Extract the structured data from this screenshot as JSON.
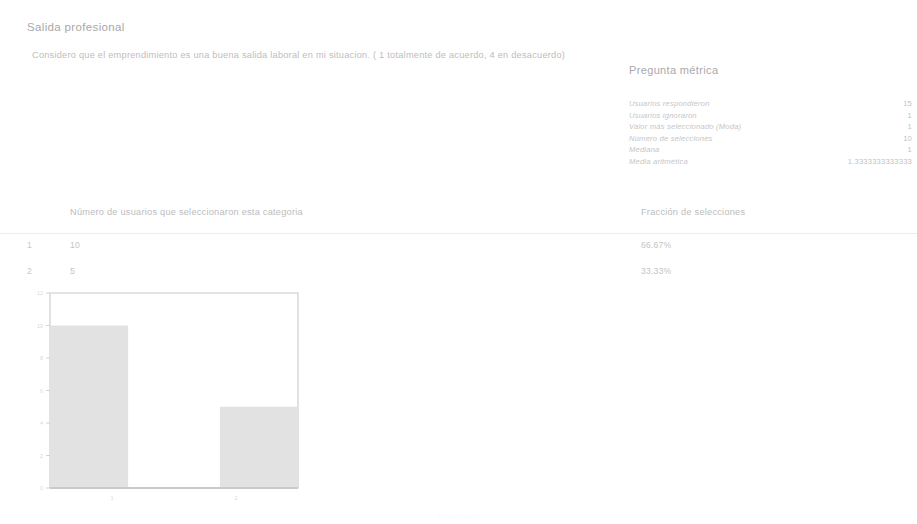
{
  "page": {
    "title": "Salida profesional",
    "question": "Considero que el emprendimiento es una buena salida laboral en mi situacion. ( 1 totalmente de acuerdo, 4 en desacuerdo)",
    "footer_note": "Resultados"
  },
  "metrics": {
    "title": "Pregunta métrica",
    "rows": [
      {
        "label": "Usuarios respondieron",
        "value": "15"
      },
      {
        "label": "Usuarios ignoraron",
        "value": "1"
      },
      {
        "label": "Valor más seleccionado (Moda)",
        "value": "1"
      },
      {
        "label": "Número de selecciones",
        "value": "10"
      },
      {
        "label": "Mediana",
        "value": "1"
      },
      {
        "label": "Media aritmética",
        "value": "1.3333333333333"
      }
    ]
  },
  "table": {
    "headers": {
      "index": "",
      "count": "Número de usuarios que seleccionaron esta categoria",
      "fraction": "Fracción de selecciones"
    },
    "rows": [
      {
        "index": "1",
        "count": "10",
        "fraction": "66.67%"
      },
      {
        "index": "2",
        "count": "5",
        "fraction": "33.33%"
      }
    ]
  },
  "chart_data": {
    "type": "bar",
    "title": "",
    "xlabel": "",
    "ylabel": "",
    "categories": [
      "1",
      "2"
    ],
    "values": [
      10,
      5
    ],
    "ylim": [
      0,
      12
    ],
    "yticks": [
      "0",
      "2",
      "4",
      "6",
      "8",
      "10",
      "12"
    ],
    "xticks": [
      "1",
      "2"
    ],
    "grid": false,
    "legend": "none",
    "bar_color": "#e2e2e2",
    "axis_color": "#c9c9c9"
  },
  "colors": {
    "text": "#bdbdbd",
    "rule": "#ececec",
    "bar_fill": "#e2e2e2",
    "frame": "#c9c9c9"
  }
}
